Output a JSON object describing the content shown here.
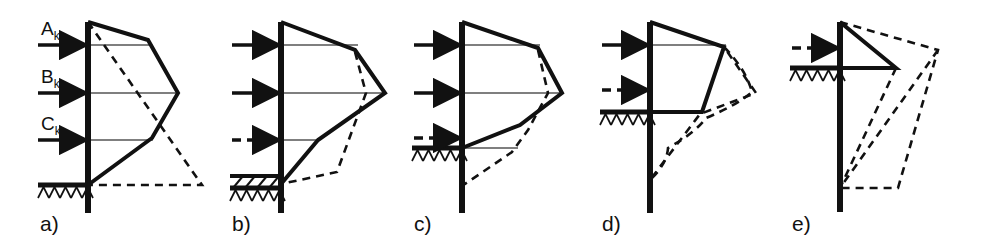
{
  "figure": {
    "width": 982,
    "height": 241,
    "background_color": "#ffffff",
    "line_color": "#111111",
    "thin_line_color": "#555555"
  },
  "load_labels": [
    {
      "id": "A",
      "base": "A",
      "sub": "k",
      "text": "Ak"
    },
    {
      "id": "B",
      "base": "B",
      "sub": "k",
      "text": "Bk"
    },
    {
      "id": "C",
      "base": "C",
      "sub": "k",
      "text": "Ck"
    }
  ],
  "panels": [
    {
      "id": "a",
      "label": "a)",
      "wall_x": 88,
      "wall_top": 22,
      "wall_bottom": 213,
      "ground_y": 185,
      "ground_x_start": 38,
      "ground_x_end": 88,
      "hatch": "ground-hatch",
      "anchors": [
        {
          "name": "Ak",
          "y": 45,
          "style": "solid",
          "x_start": 38,
          "x_end": 88
        },
        {
          "name": "Bk",
          "y": 93,
          "style": "solid",
          "x_start": 38,
          "x_end": 88
        },
        {
          "name": "Ck",
          "y": 140,
          "style": "solid",
          "x_start": 38,
          "x_end": 88
        }
      ],
      "shows_load_labels": true,
      "solid_polygon": [
        [
          88,
          22
        ],
        [
          148,
          40
        ],
        [
          178,
          93
        ],
        [
          152,
          138
        ],
        [
          88,
          185
        ]
      ],
      "dashed_shapes": [
        {
          "type": "polyline",
          "points": [
            [
              88,
              22
            ],
            [
              202,
              185
            ],
            [
              88,
              185
            ]
          ]
        }
      ],
      "thin_lines": [
        [
          [
            88,
            45
          ],
          [
            150,
            45
          ]
        ],
        [
          [
            88,
            93
          ],
          [
            178,
            93
          ]
        ],
        [
          [
            88,
            140
          ],
          [
            153,
            140
          ]
        ]
      ]
    },
    {
      "id": "b",
      "label": "b)",
      "wall_x": 281,
      "wall_top": 22,
      "wall_bottom": 213,
      "ground_y": 188,
      "ground_x_start": 230,
      "ground_x_end": 281,
      "hatch": "excavated-layer-hatch",
      "excavation_top_y": 176,
      "anchors": [
        {
          "name": "Ak",
          "y": 45,
          "style": "solid",
          "x_start": 232,
          "x_end": 281
        },
        {
          "name": "Bk",
          "y": 93,
          "style": "solid",
          "x_start": 232,
          "x_end": 281
        },
        {
          "name": "Ck",
          "y": 140,
          "style": "dashed",
          "x_start": 232,
          "x_end": 281
        }
      ],
      "shows_load_labels": false,
      "solid_polygon": [
        [
          281,
          22
        ],
        [
          355,
          50
        ],
        [
          385,
          93
        ],
        [
          318,
          140
        ],
        [
          281,
          184
        ]
      ],
      "dashed_shapes": [
        {
          "type": "polyline",
          "points": [
            [
              355,
              52
            ],
            [
              366,
              93
            ],
            [
              348,
              142
            ],
            [
              337,
              172
            ],
            [
              281,
              184
            ]
          ]
        }
      ],
      "thin_lines": [
        [
          [
            281,
            45
          ],
          [
            358,
            45
          ]
        ],
        [
          [
            281,
            93
          ],
          [
            385,
            93
          ]
        ],
        [
          [
            281,
            140
          ],
          [
            320,
            140
          ]
        ]
      ]
    },
    {
      "id": "c",
      "label": "c)",
      "wall_x": 462,
      "wall_top": 22,
      "wall_bottom": 213,
      "ground_y": 148,
      "ground_x_start": 412,
      "ground_x_end": 462,
      "hatch": "ground-hatch",
      "anchors": [
        {
          "name": "Ak",
          "y": 45,
          "style": "solid",
          "x_start": 414,
          "x_end": 462
        },
        {
          "name": "Bk",
          "y": 93,
          "style": "solid",
          "x_start": 414,
          "x_end": 462
        },
        {
          "name": "Ck",
          "y": 138,
          "style": "dashed",
          "x_start": 414,
          "x_end": 462
        }
      ],
      "shows_load_labels": false,
      "solid_polygon": [
        [
          462,
          22
        ],
        [
          538,
          48
        ],
        [
          562,
          93
        ],
        [
          520,
          125
        ],
        [
          462,
          148
        ]
      ],
      "dashed_shapes": [
        {
          "type": "polyline",
          "points": [
            [
              538,
              50
            ],
            [
              548,
              93
            ],
            [
              528,
              130
            ],
            [
              512,
              152
            ],
            [
              462,
              186
            ]
          ]
        }
      ],
      "thin_lines": [
        [
          [
            462,
            45
          ],
          [
            540,
            45
          ]
        ],
        [
          [
            462,
            93
          ],
          [
            562,
            93
          ]
        ],
        [
          [
            462,
            148
          ],
          [
            518,
            148
          ]
        ]
      ]
    },
    {
      "id": "d",
      "label": "d)",
      "wall_x": 650,
      "wall_top": 22,
      "wall_bottom": 213,
      "ground_y": 112,
      "ground_x_start": 600,
      "ground_x_end": 650,
      "hatch": "ground-hatch",
      "anchors": [
        {
          "name": "Ak",
          "y": 45,
          "style": "solid",
          "x_start": 602,
          "x_end": 650
        },
        {
          "name": "Bk",
          "y": 90,
          "style": "dashed",
          "x_start": 602,
          "x_end": 650
        }
      ],
      "shows_load_labels": false,
      "solid_polygon": [
        [
          650,
          22
        ],
        [
          724,
          47
        ],
        [
          702,
          112
        ],
        [
          650,
          112
        ]
      ],
      "dashed_shapes": [
        {
          "type": "polyline",
          "points": [
            [
              650,
              22
            ],
            [
              724,
              47
            ],
            [
              756,
              93
            ],
            [
              700,
              114
            ],
            [
              650,
              180
            ]
          ]
        },
        {
          "type": "curve",
          "points": [
            [
              724,
              47
            ],
            [
              752,
              92
            ],
            [
              706,
              118
            ],
            [
              668,
              148
            ],
            [
              650,
              180
            ]
          ]
        }
      ],
      "thin_lines": [
        [
          [
            650,
            45
          ],
          [
            726,
            45
          ]
        ],
        [
          [
            650,
            112
          ],
          [
            703,
            112
          ]
        ]
      ]
    },
    {
      "id": "e",
      "label": "e)",
      "wall_x": 840,
      "wall_top": 22,
      "wall_bottom": 212,
      "ground_y": 68,
      "ground_x_start": 790,
      "ground_x_end": 840,
      "hatch": "ground-hatch",
      "anchors": [
        {
          "name": "Ak",
          "y": 48,
          "style": "dashed",
          "x_start": 792,
          "x_end": 840
        }
      ],
      "shows_load_labels": false,
      "solid_polygon": [
        [
          840,
          22
        ],
        [
          896,
          68
        ],
        [
          840,
          68
        ]
      ],
      "dashed_shapes": [
        {
          "type": "polyline",
          "points": [
            [
              840,
              22
            ],
            [
              938,
              50
            ],
            [
              898,
              188
            ],
            [
              840,
              188
            ]
          ]
        },
        {
          "type": "polyline",
          "points": [
            [
              896,
              68
            ],
            [
              840,
              188
            ]
          ]
        },
        {
          "type": "polyline",
          "points": [
            [
              938,
              50
            ],
            [
              840,
              188
            ]
          ]
        }
      ],
      "thin_lines": [
        [
          [
            840,
            68
          ],
          [
            898,
            68
          ]
        ]
      ]
    }
  ]
}
